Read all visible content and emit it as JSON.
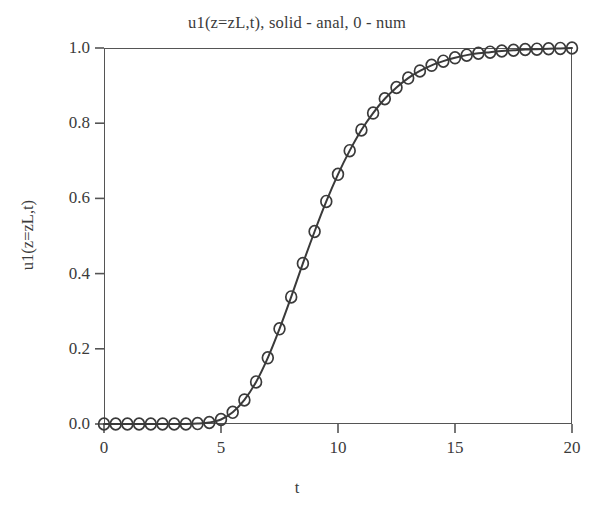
{
  "chart_data": {
    "type": "line",
    "title": "u1(z=zL,t), solid - anal, 0 - num",
    "xlabel": "t",
    "ylabel": "u1(z=zL,t)",
    "xlim": [
      0,
      20
    ],
    "ylim": [
      0.0,
      1.0
    ],
    "grid": false,
    "legend": null,
    "legend_position": "none",
    "xticks": [
      0,
      5,
      10,
      15,
      20
    ],
    "xtick_labels": [
      "0",
      "5",
      "10",
      "15",
      "20"
    ],
    "yticks": [
      0.0,
      0.2,
      0.4,
      0.6,
      0.8,
      1.0
    ],
    "ytick_labels": [
      "0.0",
      "0.2",
      "0.4",
      "0.6",
      "0.8",
      "1.0"
    ],
    "line_color": "#3a3a3a",
    "marker_color": "#3a3a3a",
    "marker": "circle-open",
    "series": [
      {
        "name": "anal",
        "style": "solid-line",
        "x": [
          0.0,
          0.5,
          1.0,
          1.5,
          2.0,
          2.5,
          3.0,
          3.5,
          4.0,
          4.5,
          5.0,
          5.5,
          6.0,
          6.5,
          7.0,
          7.5,
          8.0,
          8.5,
          9.0,
          9.5,
          10.0,
          10.5,
          11.0,
          11.5,
          12.0,
          12.5,
          13.0,
          13.5,
          14.0,
          14.5,
          15.0,
          15.5,
          16.0,
          16.5,
          17.0,
          17.5,
          18.0,
          18.5,
          19.0,
          19.5,
          20.0
        ],
        "values": [
          0.0,
          0.0,
          0.0,
          0.0,
          0.0,
          0.0,
          0.0,
          0.0,
          0.001,
          0.004,
          0.012,
          0.031,
          0.064,
          0.112,
          0.176,
          0.253,
          0.338,
          0.427,
          0.512,
          0.592,
          0.664,
          0.727,
          0.782,
          0.827,
          0.865,
          0.895,
          0.92,
          0.939,
          0.954,
          0.965,
          0.974,
          0.981,
          0.986,
          0.989,
          0.992,
          0.994,
          0.996,
          0.997,
          0.998,
          0.999,
          1.0
        ]
      },
      {
        "name": "num",
        "style": "open-circle-markers",
        "x": [
          0.0,
          0.5,
          1.0,
          1.5,
          2.0,
          2.5,
          3.0,
          3.5,
          4.0,
          4.5,
          5.0,
          5.5,
          6.0,
          6.5,
          7.0,
          7.5,
          8.0,
          8.5,
          9.0,
          9.5,
          10.0,
          10.5,
          11.0,
          11.5,
          12.0,
          12.5,
          13.0,
          13.5,
          14.0,
          14.5,
          15.0,
          15.5,
          16.0,
          16.5,
          17.0,
          17.5,
          18.0,
          18.5,
          19.0,
          19.5,
          20.0
        ],
        "values": [
          0.0,
          0.0,
          0.0,
          0.0,
          0.0,
          0.0,
          0.0,
          0.0,
          0.001,
          0.004,
          0.012,
          0.031,
          0.064,
          0.112,
          0.176,
          0.253,
          0.338,
          0.427,
          0.512,
          0.592,
          0.664,
          0.727,
          0.782,
          0.827,
          0.865,
          0.895,
          0.92,
          0.939,
          0.954,
          0.965,
          0.974,
          0.981,
          0.986,
          0.989,
          0.992,
          0.994,
          0.996,
          0.997,
          0.998,
          0.999,
          1.0
        ]
      }
    ]
  }
}
